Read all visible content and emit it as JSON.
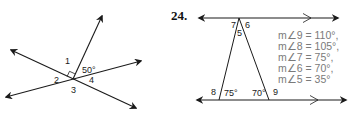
{
  "left_figure": {
    "labels": {
      "angle1": "1",
      "angle2": "2",
      "angle3": "3",
      "angle4": "4",
      "given_angle": "50°"
    },
    "right_angle_marker": true
  },
  "right_figure": {
    "problem_number": "24.",
    "angle_labels": {
      "a5": "5",
      "a6": "6",
      "a7": "7",
      "a8": "8",
      "a9": "9",
      "base_left": "75°",
      "base_right": "70°"
    },
    "givens": [
      "m∠9 = 110°,",
      "m∠8 = 105°,",
      "m∠7 = 75°,",
      "m∠6 = 70°,",
      "m∠5 = 35°"
    ],
    "parallel_marks": true
  },
  "colors": {
    "line": "#1a1a1a",
    "given_text": "#7a7a7a"
  }
}
